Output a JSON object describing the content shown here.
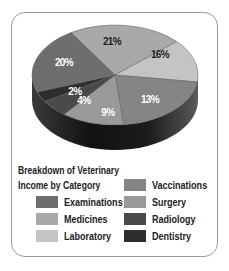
{
  "chart_data": {
    "type": "pie",
    "style": "3d",
    "title": "Breakdown of Veterinary Income by Category",
    "title_lines": [
      "Breakdown of Veterinary",
      "Income by Category"
    ],
    "legend_position": "bottom",
    "slices": [
      {
        "name": "Medicines",
        "value": 21,
        "label": "21%",
        "color": "#a9a9a9",
        "label_color": "#222222"
      },
      {
        "name": "Laboratory",
        "value": 16,
        "label": "16%",
        "color": "#c4c4c4",
        "label_color": "#222222"
      },
      {
        "name": "Vaccinations",
        "value": 13,
        "label": "13%",
        "color": "#858585",
        "label_color": "#ffffff"
      },
      {
        "name": "Surgery",
        "value": 9,
        "label": "9%",
        "color": "#9a9a9a",
        "label_color": "#ffffff"
      },
      {
        "name": "Radiology",
        "value": 4,
        "label": "4%",
        "color": "#4a4a4a",
        "label_color": "#ffffff"
      },
      {
        "name": "Dentistry",
        "value": 2,
        "label": "2%",
        "color": "#2e2e2e",
        "label_color": "#ffffff"
      },
      {
        "name": "Examinations",
        "value": 20,
        "label": "20%",
        "color": "#6e6e6e",
        "label_color": "#ffffff"
      }
    ]
  },
  "legend": {
    "title_line1": "Breakdown of Veterinary",
    "title_line2": "Income by Category",
    "left": [
      {
        "label": "Examinations",
        "color": "#6e6e6e"
      },
      {
        "label": "Medicines",
        "color": "#a9a9a9"
      },
      {
        "label": "Laboratory",
        "color": "#c4c4c4"
      }
    ],
    "right": [
      {
        "label": "Vaccinations",
        "color": "#858585"
      },
      {
        "label": "Surgery",
        "color": "#9a9a9a"
      },
      {
        "label": "Radiology",
        "color": "#4a4a4a"
      },
      {
        "label": "Dentistry",
        "color": "#2e2e2e"
      }
    ]
  }
}
